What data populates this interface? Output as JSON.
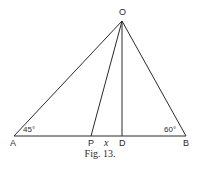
{
  "figure": {
    "caption": "Fig. 13.",
    "points": {
      "O": {
        "label": "O",
        "x": 122,
        "y": 21
      },
      "A": {
        "label": "A",
        "x": 14,
        "y": 136
      },
      "B": {
        "label": "B",
        "x": 186,
        "y": 136
      },
      "P": {
        "label": "P",
        "x": 91,
        "y": 136
      },
      "D": {
        "label": "D",
        "x": 122,
        "y": 136
      }
    },
    "angles": {
      "A": "45°",
      "B": "60°"
    },
    "segment_label": "x",
    "line_color": "#2a2a2a"
  }
}
